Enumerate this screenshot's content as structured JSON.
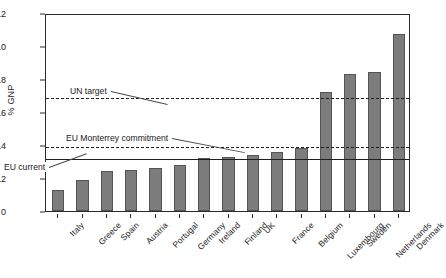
{
  "chart_data": {
    "type": "bar",
    "title": "",
    "xlabel": "",
    "ylabel": "% GNP",
    "ylim": [
      0,
      1.2
    ],
    "yticks": [
      0,
      0.2,
      0.4,
      0.6,
      0.8,
      1.0,
      1.2
    ],
    "ytick_labels": [
      "0",
      "0.2",
      "0.4",
      "0.6",
      "0.8",
      "1.0",
      "1.2"
    ],
    "grid": false,
    "legend_position": "none",
    "bar_color": "#7c7c7c",
    "bar_edge_color": "#545454",
    "categories": [
      "Italy",
      "Greece",
      "Spain",
      "Austria",
      "Portugal",
      "Germany",
      "Ireland",
      "Finland",
      "UK",
      "France",
      "Belgium",
      "Luxembourg",
      "Sweden",
      "Netherlands",
      "Denmark"
    ],
    "values": [
      0.13,
      0.19,
      0.24,
      0.25,
      0.26,
      0.28,
      0.32,
      0.33,
      0.34,
      0.36,
      0.38,
      0.72,
      0.83,
      0.84,
      1.07
    ],
    "reference_lines": [
      {
        "name": "un-target",
        "label": "UN target",
        "value": 0.7,
        "style": "dashed"
      },
      {
        "name": "eu-monterrey-commitment",
        "label": "EU Monterrey commitment",
        "value": 0.4,
        "style": "dashed"
      },
      {
        "name": "eu-current",
        "label": "EU current",
        "value": 0.33,
        "style": "solid"
      }
    ]
  }
}
